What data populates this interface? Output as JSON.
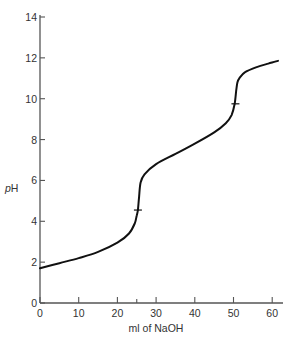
{
  "chart_data": {
    "type": "line",
    "title": "",
    "xlabel": "ml of NaOH",
    "ylabel": "pH",
    "ylabel_italic_part": "p",
    "ylabel_roman_part": "H",
    "xlim": [
      0,
      62
    ],
    "ylim": [
      0,
      14
    ],
    "grid": false,
    "legend": null,
    "x_ticks": [
      0,
      10,
      20,
      30,
      40,
      50,
      60
    ],
    "x_minor_ticks": [
      25
    ],
    "y_ticks": [
      0,
      2,
      4,
      6,
      8,
      10,
      12,
      14
    ],
    "series": [
      {
        "name": "titration curve",
        "x": [
          0,
          5,
          10,
          15,
          20,
          23,
          24.5,
          25,
          25.3,
          25.6,
          26,
          27,
          30,
          35,
          40,
          45,
          48,
          49.5,
          50.3,
          50.7,
          51,
          51.5,
          53,
          56,
          59,
          61.5
        ],
        "y": [
          1.7,
          1.95,
          2.2,
          2.5,
          2.95,
          3.4,
          3.9,
          4.3,
          4.55,
          5.2,
          5.9,
          6.3,
          6.8,
          7.3,
          7.8,
          8.35,
          8.8,
          9.2,
          9.75,
          10.4,
          10.8,
          11.0,
          11.3,
          11.55,
          11.72,
          11.85
        ]
      }
    ],
    "annotations": [
      {
        "type": "tick-mark",
        "x": 25.3,
        "y": 4.55,
        "label": "first equivalence point"
      },
      {
        "type": "tick-mark",
        "x": 50.5,
        "y": 9.75,
        "label": "second equivalence point"
      }
    ]
  },
  "axes": {
    "x_title": "ml of NaOH",
    "y_title_p": "p",
    "y_title_h": "H"
  }
}
